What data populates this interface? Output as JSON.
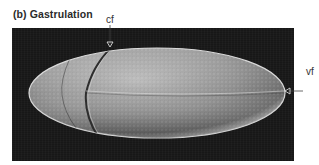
{
  "figure": {
    "title": "(b)  Gastrulation",
    "labels": {
      "cf": "cf",
      "vf": "vf"
    },
    "image_description": "Scanning electron micrograph of a Drosophila embryo during gastrulation showing cephalic furrow and ventral furrow",
    "colors": {
      "background": "#ffffff",
      "panel": "#1b1b1b",
      "embryo_light": "#d9d9d9",
      "embryo_mid": "#9a9a9a",
      "embryo_dark": "#5a5a5a"
    }
  }
}
